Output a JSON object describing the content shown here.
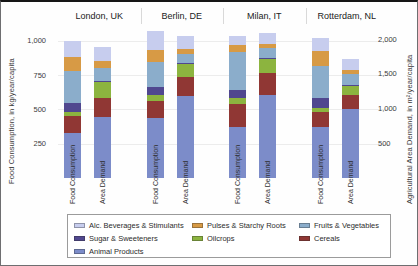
{
  "chart_data": {
    "type": "bar",
    "stacked": true,
    "grid": true,
    "group_titles": [
      "London, UK",
      "Berlin, DE",
      "Milan, IT",
      "Rotterdam, NL"
    ],
    "bar_labels": [
      "Food Consumption",
      "Area Demand"
    ],
    "left_axis": {
      "label": "Food Consumption, in kg/year/capita",
      "tick_labels": [
        "250",
        "500",
        "750",
        "1,000"
      ],
      "tick_values": [
        250,
        500,
        750,
        1000
      ],
      "range": [
        0,
        1080
      ]
    },
    "right_axis": {
      "label": "Agricultural Area Demand, in m²/year/capita",
      "tick_labels": [
        "500",
        "1,000",
        "1,500",
        "2,000"
      ],
      "tick_values": [
        500,
        1000,
        1500,
        2000
      ],
      "range": [
        0,
        2130
      ]
    },
    "stack_order_bottom_to_top": [
      "Animal Products",
      "Cereals",
      "Oilcrops",
      "Sugar & Sweeteners",
      "Fruits & Vegetables",
      "Pulses & Starchy Roots",
      "Alc. Beverages & Stimulants"
    ],
    "colors": {
      "Animal Products": "#7c8cc9",
      "Cereals": "#903734",
      "Oilcrops": "#8cb43f",
      "Sugar & Sweeteners": "#50478f",
      "Fruits & Vegetables": "#8badcb",
      "Pulses & Starchy Roots": "#d79a45",
      "Alc. Beverages & Stimulants": "#c7cdee"
    },
    "series": [
      {
        "group": "London, UK",
        "bar": "Food Consumption",
        "axis": "left",
        "values": {
          "Animal Products": 325,
          "Cereals": 130,
          "Oilcrops": 30,
          "Sugar & Sweeteners": 60,
          "Fruits & Vegetables": 235,
          "Pulses & Starchy Roots": 100,
          "Alc. Beverages & Stimulants": 120
        }
      },
      {
        "group": "London, UK",
        "bar": "Area Demand",
        "axis": "right",
        "values": {
          "Animal Products": 885,
          "Cereals": 260,
          "Oilcrops": 235,
          "Sugar & Sweeteners": 15,
          "Fruits & Vegetables": 190,
          "Pulses & Starchy Roots": 95,
          "Alc. Beverages & Stimulants": 205
        }
      },
      {
        "group": "Berlin, DE",
        "bar": "Food Consumption",
        "axis": "left",
        "values": {
          "Animal Products": 435,
          "Cereals": 125,
          "Oilcrops": 45,
          "Sugar & Sweeteners": 60,
          "Fruits & Vegetables": 185,
          "Pulses & Starchy Roots": 85,
          "Alc. Beverages & Stimulants": 140
        }
      },
      {
        "group": "Berlin, DE",
        "bar": "Area Demand",
        "axis": "right",
        "values": {
          "Animal Products": 1180,
          "Cereals": 275,
          "Oilcrops": 185,
          "Sugar & Sweeteners": 15,
          "Fruits & Vegetables": 135,
          "Pulses & Starchy Roots": 70,
          "Alc. Beverages & Stimulants": 190
        }
      },
      {
        "group": "Milan, IT",
        "bar": "Food Consumption",
        "axis": "left",
        "values": {
          "Animal Products": 375,
          "Cereals": 165,
          "Oilcrops": 45,
          "Sugar & Sweeteners": 60,
          "Fruits & Vegetables": 275,
          "Pulses & Starchy Roots": 50,
          "Alc. Beverages & Stimulants": 65
        }
      },
      {
        "group": "Milan, IT",
        "bar": "Area Demand",
        "axis": "right",
        "values": {
          "Animal Products": 1200,
          "Cereals": 305,
          "Oilcrops": 210,
          "Sugar & Sweeteners": 15,
          "Fruits & Vegetables": 140,
          "Pulses & Starchy Roots": 55,
          "Alc. Beverages & Stimulants": 155
        }
      },
      {
        "group": "Rotterdam, NL",
        "bar": "Food Consumption",
        "axis": "left",
        "values": {
          "Animal Products": 375,
          "Cereals": 110,
          "Oilcrops": 25,
          "Sugar & Sweeteners": 75,
          "Fruits & Vegetables": 235,
          "Pulses & Starchy Roots": 110,
          "Alc. Beverages & Stimulants": 90
        }
      },
      {
        "group": "Rotterdam, NL",
        "bar": "Area Demand",
        "axis": "right",
        "values": {
          "Animal Products": 990,
          "Cereals": 200,
          "Oilcrops": 145,
          "Sugar & Sweeteners": 10,
          "Fruits & Vegetables": 145,
          "Pulses & Starchy Roots": 60,
          "Alc. Beverages & Stimulants": 165
        }
      }
    ],
    "legend": {
      "position": "bottom",
      "columns": 3,
      "items": [
        "Alc. Beverages & Stimulants",
        "Pulses & Starchy Roots",
        "Fruits & Vegetables",
        "Sugar & Sweeteners",
        "Oilcrops",
        "Cereals",
        "Animal Products"
      ]
    }
  }
}
